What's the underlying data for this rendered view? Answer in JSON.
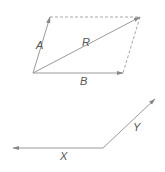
{
  "diagram": {
    "title": "",
    "colors": {
      "stroke": "#9a9a9a",
      "dashed": "#a8a8a8",
      "label": "#555555",
      "arrow": "#888888"
    },
    "parallelogram": {
      "vectors": [
        {
          "label": "A",
          "from": [
            33,
            73
          ],
          "to": [
            50,
            17
          ],
          "label_pos": [
            36,
            49
          ]
        },
        {
          "label": "B",
          "from": [
            33,
            73
          ],
          "to": [
            123,
            73
          ],
          "label_pos": [
            80,
            85
          ]
        },
        {
          "label": "R",
          "from": [
            33,
            73
          ],
          "to": [
            140,
            17
          ],
          "label_pos": [
            82,
            46
          ]
        }
      ],
      "dashed_edges": [
        {
          "from": [
            50,
            17
          ],
          "to": [
            140,
            17
          ]
        },
        {
          "from": [
            140,
            17
          ],
          "to": [
            123,
            73
          ]
        }
      ]
    },
    "pair": {
      "vectors": [
        {
          "label": "X",
          "from": [
            103,
            148
          ],
          "to": [
            13,
            148
          ],
          "label_pos": [
            60,
            160
          ]
        },
        {
          "label": "Y",
          "from": [
            103,
            148
          ],
          "to": [
            155,
            99
          ],
          "label_pos": [
            133,
            131
          ]
        }
      ]
    }
  }
}
